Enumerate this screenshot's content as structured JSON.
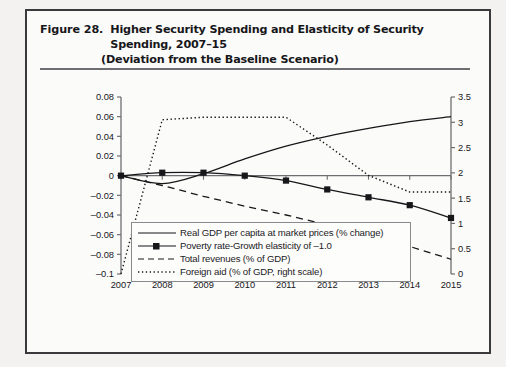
{
  "figure": {
    "number": "Figure 28.",
    "title_line1": "Higher Security Spending and Elasticity of Security Spending, 2007–15",
    "title_line2": "(Deviation from the Baseline Scenario)"
  },
  "chart_data": {
    "type": "line",
    "title": "Higher Security Spending and Elasticity of Security Spending, 2007–15 (Deviation from the Baseline Scenario)",
    "xlabel": "",
    "ylabel": "",
    "x": [
      "2007",
      "2008",
      "2009",
      "2010",
      "2011",
      "2012",
      "2013",
      "2014",
      "2015"
    ],
    "xtick_labels": [
      "2007",
      "2008",
      "2009",
      "2010",
      "2011",
      "2012",
      "2013",
      "2014",
      "2015"
    ],
    "ylim": [
      -0.1,
      0.08
    ],
    "ytick_labels": [
      "0.08",
      "0.06",
      "0.04",
      "0.02",
      "0",
      "–0.02",
      "–0.04",
      "–0.06",
      "–0.08",
      "–0.1"
    ],
    "ytick_values": [
      0.08,
      0.06,
      0.04,
      0.02,
      0,
      -0.02,
      -0.04,
      -0.06,
      -0.08,
      -0.1
    ],
    "y2lim": [
      0,
      3.5
    ],
    "y2tick_labels": [
      "3.5",
      "3",
      "2.5",
      "2",
      "1.5",
      "1",
      "0.5",
      "0"
    ],
    "y2tick_values": [
      3.5,
      3,
      2.5,
      2,
      1.5,
      1,
      0.5,
      0
    ],
    "grid": false,
    "legend_position": "below-axes",
    "series": [
      {
        "name": "Real GDP per capita at market prices (% change)",
        "axis": "left",
        "style": "solid",
        "marker": "none",
        "values": [
          0,
          -0.008,
          0.002,
          0.017,
          0.03,
          0.04,
          0.048,
          0.055,
          0.06
        ]
      },
      {
        "name": "Poverty rate-Growth elasticity of –1.0",
        "axis": "left",
        "style": "solid",
        "marker": "square",
        "values": [
          0,
          0.003,
          0.003,
          0.0,
          -0.005,
          -0.014,
          -0.022,
          -0.03,
          -0.043
        ]
      },
      {
        "name": "Total revenues (% of GDP)",
        "axis": "left",
        "style": "dashed",
        "marker": "none",
        "values": [
          0,
          -0.01,
          -0.021,
          -0.031,
          -0.04,
          -0.05,
          -0.06,
          -0.072,
          -0.085
        ]
      },
      {
        "name": "Foreign aid (% of GDP, right scale)",
        "axis": "right",
        "style": "dotted",
        "marker": "none",
        "values": [
          0.0,
          3.05,
          3.1,
          3.1,
          3.1,
          2.55,
          1.95,
          1.62,
          1.62
        ]
      }
    ]
  },
  "legend": {
    "items": [
      {
        "label": "Real GDP per capita at market prices (% change)",
        "key": "solid-line-key"
      },
      {
        "label": "Poverty rate-Growth elasticity of –1.0",
        "key": "solid-line-square-marker-key"
      },
      {
        "label": "Total revenues (% of GDP)",
        "key": "dashed-line-key"
      },
      {
        "label": "Foreign aid (% of GDP, right scale)",
        "key": "dotted-line-key"
      }
    ]
  },
  "colors": {
    "ink": "#17171a",
    "axis": "#6e6e72",
    "paper": "#fbfbfa",
    "frame": "#3a3a3c"
  }
}
